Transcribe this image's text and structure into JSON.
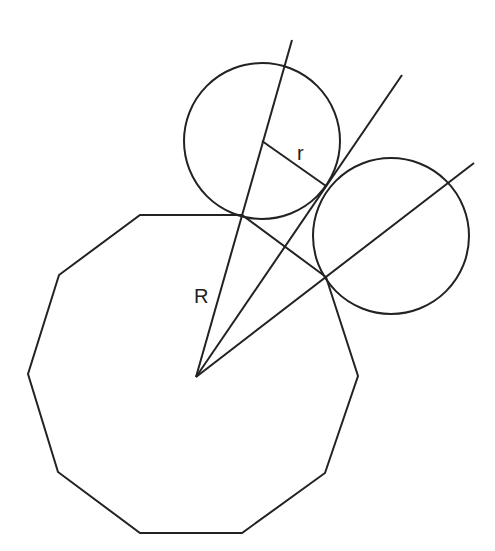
{
  "diagram": {
    "stroke_color": "#222222",
    "background": "#ffffff",
    "labels": {
      "R": "R",
      "r": "r"
    },
    "polygon": {
      "sides": 10,
      "center": [
        196,
        377
      ],
      "vertices": [
        [
          140,
          215
        ],
        [
          242,
          215
        ],
        [
          326,
          277
        ],
        [
          358,
          376
        ],
        [
          325,
          473
        ],
        [
          242,
          533
        ],
        [
          140,
          533
        ],
        [
          58,
          472
        ],
        [
          28,
          374
        ],
        [
          59,
          275
        ]
      ]
    },
    "circles": [
      {
        "name": "circle-upper",
        "cx": 262,
        "cy": 141,
        "r": 78
      },
      {
        "name": "circle-right",
        "cx": 391,
        "cy": 236,
        "r": 78
      }
    ],
    "rays_from_center": [
      {
        "name": "ray-R",
        "to": [
          292,
          40
        ]
      },
      {
        "name": "ray-tangent",
        "to": [
          402,
          75
        ]
      },
      {
        "name": "ray-right",
        "to": [
          474,
          163
        ]
      }
    ],
    "radius_segment_r": {
      "from": [
        262,
        141
      ],
      "to": [
        326,
        186
      ]
    }
  }
}
